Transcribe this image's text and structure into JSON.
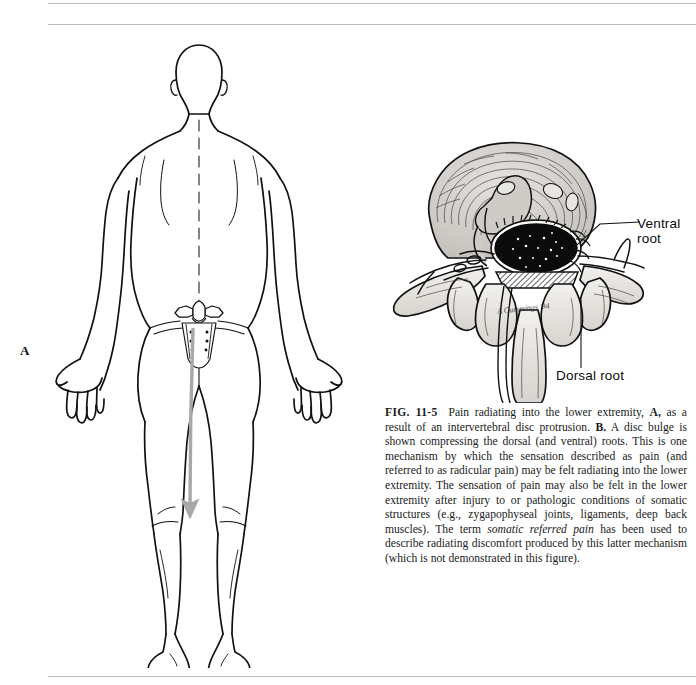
{
  "figure": {
    "number": "FIG. 11-5",
    "panel_a_label": "A",
    "artist_signature": "A Cummings '94"
  },
  "labels": {
    "ventral_root_line1": "Ventral",
    "ventral_root_line2": "root",
    "dorsal_root": "Dorsal root"
  },
  "caption": {
    "fig_no": "FIG. 11-5",
    "part1": "Pain radiating into the lower extremity, ",
    "ref_a": "A,",
    "part2": " as a result of an intervertebral disc protrusion. ",
    "ref_b": "B.",
    "part3": " A disc bulge is shown compressing the dorsal (and ventral) roots. This is one mechanism by which the sensation described as pain (and referred to as radicular pain) may be felt radiating into the lower extremity. The sensation of pain may also be felt in the lower extremity after injury to or pathologic conditions of somatic structures (e.g., zygapophyseal joints, ligaments, deep back muscles). The term ",
    "italic_term": "somatic referred pain",
    "part4": " has been used to describe radiating discomfort produced by this latter mechanism (which is not demonstrated in this figure)."
  },
  "colors": {
    "ink": "#111111",
    "rule": "#b9b9b9",
    "pain_arrow": "#a8a8a8",
    "disc_gray": "#c9c9c9",
    "bone_gray": "#d8d5d0"
  }
}
